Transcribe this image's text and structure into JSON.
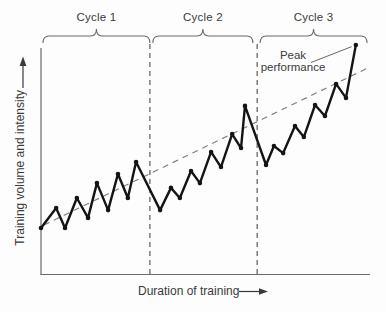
{
  "colors": {
    "background": "#fdfdfd",
    "data_line": "#141414",
    "axis_line": "#6a6a6a",
    "divider_line": "#5a5a5a",
    "trend_line": "#7d7d7d",
    "text": "#3a3a3a"
  },
  "icons": {
    "y_axis_arrow": "up-arrow",
    "x_axis_arrow": "right-arrow"
  },
  "chart_data": {
    "type": "line",
    "title": "",
    "xlabel": "Duration of training",
    "ylabel": "Training volume and intensity",
    "grid": false,
    "axis_ranges": {
      "x": [
        0,
        100
      ],
      "y": [
        0,
        100
      ]
    },
    "series": [
      {
        "name": "training-load",
        "style": "solid-with-markers",
        "points": [
          [
            0.0,
            20.1
          ],
          [
            4.6,
            28.8
          ],
          [
            7.3,
            20.1
          ],
          [
            10.9,
            33.2
          ],
          [
            14.3,
            24.5
          ],
          [
            17.0,
            39.7
          ],
          [
            20.4,
            27.9
          ],
          [
            23.4,
            43.7
          ],
          [
            26.4,
            33.2
          ],
          [
            28.9,
            48.9
          ],
          [
            36.2,
            27.9
          ],
          [
            39.5,
            37.6
          ],
          [
            42.2,
            33.2
          ],
          [
            45.6,
            45.0
          ],
          [
            48.3,
            39.7
          ],
          [
            51.7,
            53.3
          ],
          [
            54.7,
            46.7
          ],
          [
            58.1,
            61.1
          ],
          [
            60.8,
            55.0
          ],
          [
            62.0,
            73.4
          ],
          [
            68.4,
            47.6
          ],
          [
            70.8,
            55.9
          ],
          [
            73.6,
            52.8
          ],
          [
            77.2,
            64.6
          ],
          [
            79.9,
            59.8
          ],
          [
            83.3,
            73.8
          ],
          [
            86.3,
            69.0
          ],
          [
            89.7,
            83.0
          ],
          [
            92.7,
            76.9
          ],
          [
            95.7,
            100.0
          ]
        ]
      },
      {
        "name": "progress-trend",
        "style": "dashed",
        "points": [
          [
            0.9,
            21.4
          ],
          [
            99.4,
            90.0
          ]
        ]
      }
    ],
    "cycles": [
      {
        "label": "Cycle 1",
        "x_start": 0.6,
        "x_end": 33.1
      },
      {
        "label": "Cycle 2",
        "x_start": 34.0,
        "x_end": 64.4
      },
      {
        "label": "Cycle 3",
        "x_start": 66.6,
        "x_end": 99.1
      }
    ],
    "dividers_x": [
      33.1,
      65.7
    ],
    "annotation": {
      "label": "Peak performance",
      "target_point": [
        95.7,
        100.0
      ]
    }
  }
}
